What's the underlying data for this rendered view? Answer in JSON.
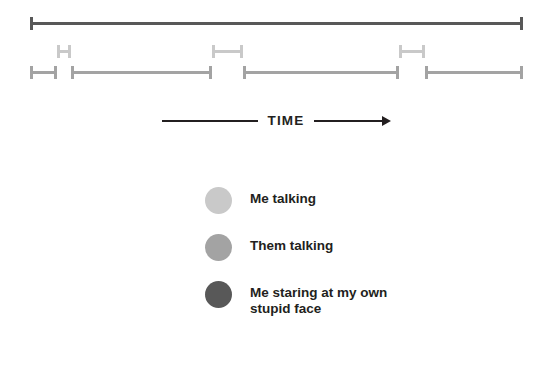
{
  "colors": {
    "background": "#ffffff",
    "ink": "#231f20",
    "me_talking": "#c9c9c9",
    "them_talking": "#a3a3a3",
    "me_staring": "#585858"
  },
  "timeline": {
    "title": "conversation-timeline",
    "rows": [
      {
        "name": "me-staring-track",
        "category": "Me staring at my own stupid face",
        "color": "#585858",
        "y": 22,
        "segments": [
          {
            "label": "staring-segment-1",
            "start": 30,
            "end": 523
          }
        ]
      },
      {
        "name": "me-talking-track",
        "category": "Me talking",
        "color": "#c9c9c9",
        "y": 50,
        "segments": [
          {
            "label": "me-talking-segment-1",
            "start": 57,
            "end": 71
          },
          {
            "label": "me-talking-segment-2",
            "start": 212,
            "end": 243
          },
          {
            "label": "me-talking-segment-3",
            "start": 399,
            "end": 425
          }
        ]
      },
      {
        "name": "them-talking-track",
        "category": "Them talking",
        "color": "#a3a3a3",
        "y": 71,
        "segments": [
          {
            "label": "them-talking-segment-1",
            "start": 30,
            "end": 57
          },
          {
            "label": "them-talking-segment-2",
            "start": 71,
            "end": 212
          },
          {
            "label": "them-talking-segment-3",
            "start": 243,
            "end": 399
          },
          {
            "label": "them-talking-segment-4",
            "start": 425,
            "end": 523
          }
        ]
      }
    ]
  },
  "axis": {
    "label": "TIME",
    "direction": "left-to-right",
    "arrow_icon": "arrow-right-icon"
  },
  "legend": {
    "items": [
      {
        "label": "Me talking",
        "color": "#c9c9c9",
        "dot_name": "legend-dot-me-talking"
      },
      {
        "label": "Them talking",
        "color": "#a3a3a3",
        "dot_name": "legend-dot-them-talking"
      },
      {
        "label": "Me staring at my own\nstupid face",
        "color": "#585858",
        "dot_name": "legend-dot-me-staring"
      }
    ]
  }
}
